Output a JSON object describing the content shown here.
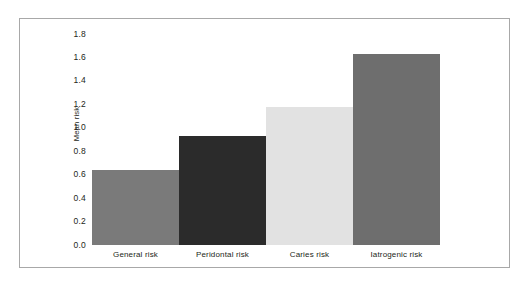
{
  "chart_data": {
    "type": "bar",
    "title": "",
    "subtitle": "",
    "xlabel": "",
    "ylabel": "Mean risk",
    "categories": [
      "General risk",
      "Peridontal risk",
      "Caries risk",
      "Iatrogenic risk"
    ],
    "values": [
      0.64,
      0.93,
      1.18,
      1.63
    ],
    "bar_colors": [
      "#7a7a7a",
      "#2b2b2b",
      "#e2e2e2",
      "#6e6e6e"
    ],
    "ylim": [
      0.0,
      1.8
    ],
    "yticks": [
      "0.0",
      "0.2",
      "0.4",
      "0.6",
      "0.8",
      "1.0",
      "1.2",
      "1.4",
      "1.6",
      "1.8"
    ],
    "ytick_values": [
      0.0,
      0.2,
      0.4,
      0.6,
      0.8,
      1.0,
      1.2,
      1.4,
      1.6,
      1.8
    ],
    "grid": false,
    "legend": null,
    "legend_position": "none",
    "annotations": [],
    "frame_color": "#a8a8a8",
    "text_color": "#231f20",
    "background": "#ffffff"
  }
}
